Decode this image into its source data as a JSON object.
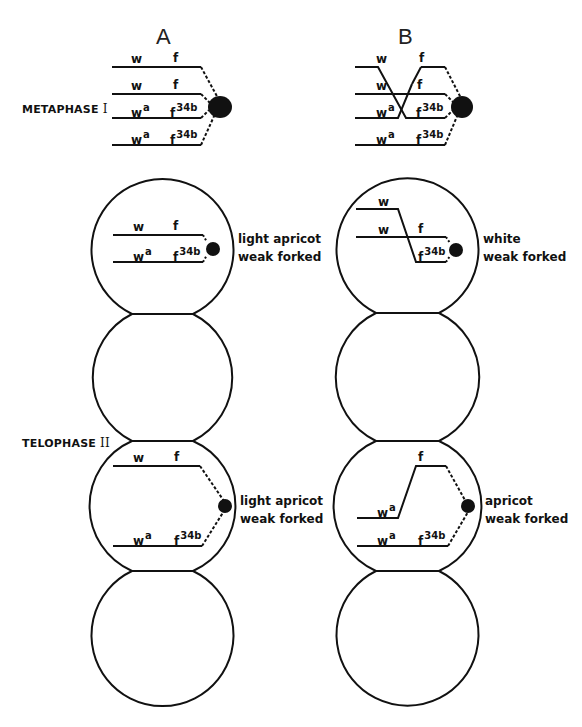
{
  "columns": {
    "A": {
      "title": "A"
    },
    "B": {
      "title": "B"
    }
  },
  "stages": {
    "metaphase": {
      "label": "METAPHASE",
      "roman": "I"
    },
    "telophase": {
      "label": "TELOPHASE",
      "roman": "II"
    }
  },
  "genes": {
    "w": "w",
    "f": "f",
    "wa_base": "w",
    "wa_sup": "a",
    "f34b_base": "f",
    "f34b_sup": "34b"
  },
  "phenotypes": {
    "A_top": {
      "line1": "light apricot",
      "line2": "weak forked"
    },
    "B_top": {
      "line1": "white",
      "line2": "weak forked"
    },
    "A_bottom": {
      "line1": "light apricot",
      "line2": "weak forked"
    },
    "B_bottom": {
      "line1": "apricot",
      "line2": "weak forked"
    }
  }
}
